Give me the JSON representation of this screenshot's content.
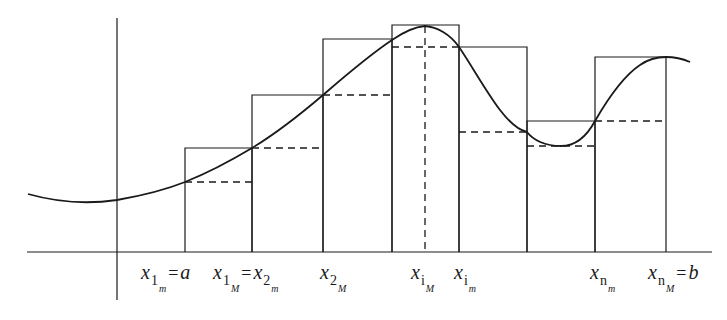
{
  "diagram": {
    "type": "riemann-sum-upper-lower",
    "stroke_color": "#1a1a1a",
    "background": "#ffffff",
    "axes": {
      "x_axis": {
        "x1": 27,
        "x2": 712,
        "y": 252
      },
      "y_axis": {
        "x": 117,
        "y1": 18,
        "y2": 300
      }
    },
    "curve_path": "M 28 194 C 60 203, 90 204, 117 200 C 140 196, 165 190, 185 182 C 210 172, 232 160, 252 148 C 280 131, 302 113, 323 95 C 345 76, 368 56, 392 40 C 405 31, 414 27, 425 26 C 437 27, 450 34, 459 47 C 472 66, 485 90, 500 110 C 510 123, 518 130, 527 132 C 533 140, 545 146, 561 146 C 577 146, 588 134, 595 121 C 610 95, 625 75, 640 65 C 650 58, 658 57, 666 57 C 675 57, 683 59, 690 62",
    "rectangles": [
      {
        "x_left": 185,
        "x_right": 252,
        "upper_y": 148,
        "lower_y": 182
      },
      {
        "x_left": 252,
        "x_right": 323,
        "upper_y": 95,
        "lower_y": 148
      },
      {
        "x_left": 323,
        "x_right": 392,
        "upper_y": 39,
        "lower_y": 95
      },
      {
        "x_left": 392,
        "x_right": 459,
        "upper_y": 25,
        "lower_y": 47
      },
      {
        "x_left": 459,
        "x_right": 527,
        "upper_y": 47,
        "lower_y": 132
      },
      {
        "x_left": 527,
        "x_right": 595,
        "upper_y": 121,
        "lower_y": 146
      },
      {
        "x_left": 595,
        "x_right": 666,
        "upper_y": 57,
        "lower_y": 121
      }
    ],
    "vertical_dashed": {
      "x": 425,
      "y1": 26,
      "y2": 252
    },
    "labels": [
      {
        "id": "x1m",
        "base": "x",
        "sub": "1",
        "sub2": "m",
        "eq": "=",
        "rhs": "a",
        "x": 141,
        "y": 262
      },
      {
        "id": "x1M",
        "base": "x",
        "sub": "1",
        "sub2": "M",
        "eq": "=",
        "rhs": "x",
        "rhs_sub": "2",
        "rhs_sub2": "m",
        "x": 213,
        "y": 262
      },
      {
        "id": "x2M",
        "base": "x",
        "sub": "2",
        "sub2": "M",
        "x": 320,
        "y": 262
      },
      {
        "id": "xiM",
        "base": "x",
        "sub": "i",
        "sub2": "M",
        "x": 411,
        "y": 262
      },
      {
        "id": "xim",
        "base": "x",
        "sub": "i",
        "sub2": "m",
        "x": 454,
        "y": 262
      },
      {
        "id": "xnm",
        "base": "x",
        "sub": "n",
        "sub2": "m",
        "x": 590,
        "y": 262
      },
      {
        "id": "xnM",
        "base": "x",
        "sub": "n",
        "sub2": "M",
        "eq": "=",
        "rhs": "b",
        "x": 648,
        "y": 262
      }
    ]
  }
}
